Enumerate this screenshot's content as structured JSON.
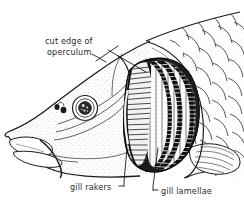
{
  "figure": {
    "background_color": "#ffffff",
    "ink_color": "#1a1a1a",
    "label_color": "#2b2b2b"
  },
  "labels": {
    "operculum": {
      "line1": "cut edge of",
      "line2": "operculum"
    },
    "gill_rakers": "gill rakers",
    "gill_lamellae": "gill lamellae"
  },
  "anatomy": {
    "eye": "eye",
    "nostrils": "nostril-pair",
    "barbel": "barbel",
    "mouth": "mouth",
    "scales": "body-scales",
    "pectoral_fin": "pectoral-fin",
    "gill_chamber": "gill-chamber",
    "gill_arches": "gill-arches",
    "operculum_edge": "cut-operculum-edge"
  }
}
